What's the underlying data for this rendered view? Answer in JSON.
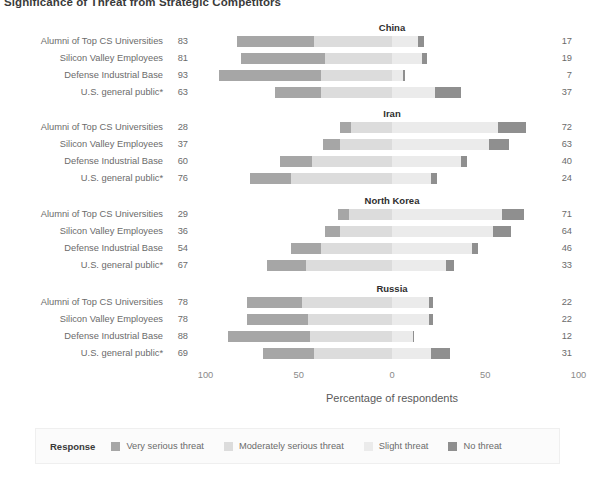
{
  "title": "Significance of Threat from Strategic Competitors",
  "axis": {
    "label": "Percentage of respondents",
    "ticks": [
      "100",
      "50",
      "0",
      "50",
      "100"
    ],
    "tick_values": [
      -100,
      -50,
      0,
      50,
      100
    ],
    "range": [
      -100,
      100
    ]
  },
  "legend": {
    "title": "Response",
    "items": [
      {
        "label": "Very serious threat",
        "color": "#a6a6a6"
      },
      {
        "label": "Moderately serious threat",
        "color": "#dcdcdc"
      },
      {
        "label": "Slight threat",
        "color": "#ebebeb"
      },
      {
        "label": "No threat",
        "color": "#8f8f8f"
      }
    ]
  },
  "groups": [
    "Alumni of Top CS Universities",
    "Silicon Valley Employees",
    "Defense Industrial Base",
    "U.S. general public*"
  ],
  "chart_data": {
    "type": "bar",
    "subtype": "diverging-stacked-likert",
    "title": "Significance of Threat from Strategic Competitors",
    "xlabel": "Percentage of respondents",
    "ylabel": "",
    "xlim": [
      -100,
      100
    ],
    "xticks": [
      -100,
      -50,
      0,
      50,
      100
    ],
    "xticklabels": [
      "100",
      "50",
      "0",
      "50",
      "100"
    ],
    "grid": false,
    "legend_position": "bottom",
    "response_levels": [
      "Very serious threat",
      "Moderately serious threat",
      "Slight threat",
      "No threat"
    ],
    "panels": [
      {
        "name": "China",
        "rows": [
          {
            "group": "Alumni of Top CS Universities",
            "left_total": 83,
            "right_total": 17,
            "values": [
              41,
              42,
              14,
              3
            ]
          },
          {
            "group": "Silicon Valley Employees",
            "left_total": 81,
            "right_total": 19,
            "values": [
              45,
              36,
              16,
              3
            ]
          },
          {
            "group": "Defense Industrial Base",
            "left_total": 93,
            "right_total": 7,
            "values": [
              55,
              38,
              6,
              1
            ]
          },
          {
            "group": "U.S. general public*",
            "left_total": 63,
            "right_total": 37,
            "values": [
              25,
              38,
              23,
              14
            ]
          }
        ]
      },
      {
        "name": "Iran",
        "rows": [
          {
            "group": "Alumni of Top CS Universities",
            "left_total": 28,
            "right_total": 72,
            "values": [
              6,
              22,
              57,
              15
            ]
          },
          {
            "group": "Silicon Valley Employees",
            "left_total": 37,
            "right_total": 63,
            "values": [
              9,
              28,
              52,
              11
            ]
          },
          {
            "group": "Defense Industrial Base",
            "left_total": 60,
            "right_total": 40,
            "values": [
              17,
              43,
              37,
              3
            ]
          },
          {
            "group": "U.S. general public*",
            "left_total": 76,
            "right_total": 24,
            "values": [
              22,
              54,
              21,
              3
            ]
          }
        ]
      },
      {
        "name": "North Korea",
        "rows": [
          {
            "group": "Alumni of Top CS Universities",
            "left_total": 29,
            "right_total": 71,
            "values": [
              6,
              23,
              59,
              12
            ]
          },
          {
            "group": "Silicon Valley Employees",
            "left_total": 36,
            "right_total": 64,
            "values": [
              8,
              28,
              54,
              10
            ]
          },
          {
            "group": "Defense Industrial Base",
            "left_total": 54,
            "right_total": 46,
            "values": [
              16,
              38,
              43,
              3
            ]
          },
          {
            "group": "U.S. general public*",
            "left_total": 67,
            "right_total": 33,
            "values": [
              21,
              46,
              29,
              4
            ]
          }
        ]
      },
      {
        "name": "Russia",
        "rows": [
          {
            "group": "Alumni of Top CS Universities",
            "left_total": 78,
            "right_total": 22,
            "values": [
              30,
              48,
              20,
              2
            ]
          },
          {
            "group": "Silicon Valley Employees",
            "left_total": 78,
            "right_total": 22,
            "values": [
              33,
              45,
              20,
              2
            ]
          },
          {
            "group": "Defense Industrial Base",
            "left_total": 88,
            "right_total": 12,
            "values": [
              44,
              44,
              11,
              1
            ]
          },
          {
            "group": "U.S. general public*",
            "left_total": 69,
            "right_total": 31,
            "values": [
              27,
              42,
              21,
              10
            ]
          }
        ]
      }
    ]
  }
}
